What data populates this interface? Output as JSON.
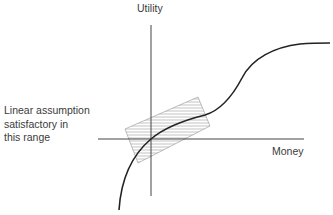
{
  "diagram": {
    "y_axis_label": "Utility",
    "x_axis_label": "Money",
    "annotation": {
      "lines": [
        "Linear assumption",
        "satisfactory in",
        "this range"
      ]
    },
    "colors": {
      "axis": "#444444",
      "curve": "#222222",
      "hatch": "#9a9a9a",
      "text": "#3b3b3b"
    }
  }
}
